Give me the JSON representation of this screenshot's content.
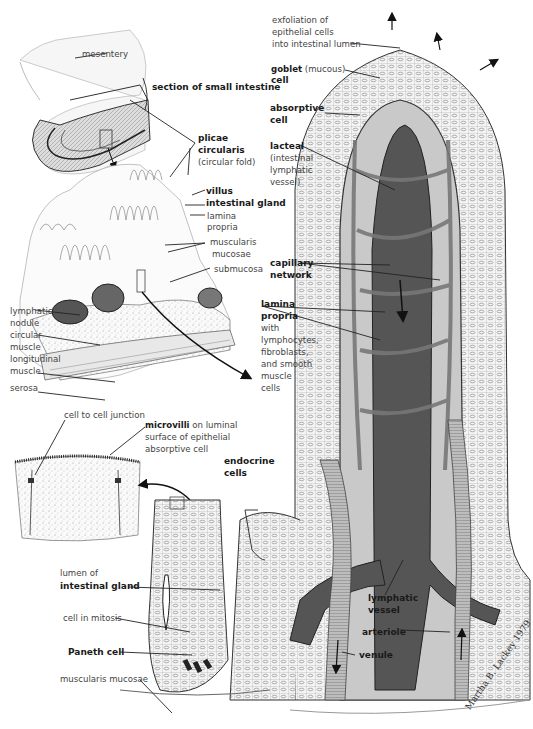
{
  "figure": {
    "colors": {
      "lacteal": "#555555",
      "capillary": "#8a8a8a",
      "lamina_propria": "#bdbdbd",
      "epithelium_line": "#333333",
      "background": "#ffffff"
    },
    "signature": "Martha B. Lackey 1979"
  },
  "labels": {
    "mesentery": "mesentery",
    "section_small_intestine": "section of small intestine",
    "plicae_1": "plicae",
    "plicae_2": "circularis",
    "plicae_sub": "(circular fold)",
    "villus": "villus",
    "intestinal_gland": "intestinal gland",
    "lamina_propria_1": "lamina",
    "lamina_propria_2": "propria",
    "muscularis_mucosae_1": "muscularis",
    "muscularis_mucosae_2": "mucosae",
    "submucosa": "submucosa",
    "lymphatic_nodule_1": "lymphatic",
    "lymphatic_nodule_2": "nodule",
    "circular_muscle_1": "circular",
    "circular_muscle_2": "muscle",
    "longitudinal_muscle_1": "longitudinal",
    "longitudinal_muscle_2": "muscle",
    "serosa": "serosa",
    "exfoliation_1": "exfoliation of",
    "exfoliation_2": "epithelial cells",
    "exfoliation_3": "into intestinal lumen",
    "goblet_bold": "goblet",
    "goblet_light": "(mucous)",
    "goblet_2": "cell",
    "absorptive_1": "absorptive",
    "absorptive_2": "cell",
    "lacteal_bold": "lacteal",
    "lacteal_1": "(intestinal",
    "lacteal_2": "lymphatic",
    "lacteal_3": "vessel)",
    "capillary_1": "capillary",
    "capillary_2": "network",
    "lp_right_1": "lamina",
    "lp_right_2": "propria",
    "lp_right_3": "with",
    "lp_right_4": "lymphocytes,",
    "lp_right_5": "fibroblasts,",
    "lp_right_6": "and smooth",
    "lp_right_7": "muscle",
    "lp_right_8": "cells",
    "cell_junction": "cell to cell junction",
    "microvilli_bold": "microvilli",
    "microvilli_1": "on luminal",
    "microvilli_2": "surface of epithelial",
    "microvilli_3": "absorptive cell",
    "endocrine_1": "endocrine",
    "endocrine_2": "cells",
    "lumen_of": "lumen of",
    "intestinal_gland_2": "intestinal gland",
    "cell_mitosis": "cell in mitosis",
    "paneth": "Paneth cell",
    "muscularis_mucosae_bottom": "muscularis mucosae",
    "lymphatic_vessel_1": "lymphatic",
    "lymphatic_vessel_2": "vessel",
    "arteriole": "arteriole",
    "venule": "venule"
  }
}
